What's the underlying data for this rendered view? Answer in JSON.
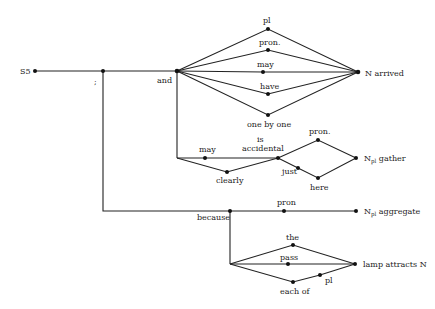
{
  "diagram": {
    "type": "sentence-generation-network",
    "start_label": "S5",
    "nodes": [
      {
        "id": "s5",
        "x": 35,
        "y": 71,
        "label": "S5"
      },
      {
        "id": "semi",
        "x": 103,
        "y": 71,
        "label": ";"
      },
      {
        "id": "and",
        "x": 177,
        "y": 71,
        "label": "and"
      },
      {
        "id": "pl1",
        "x": 268,
        "y": 29,
        "label": "pl"
      },
      {
        "id": "pron1",
        "x": 268,
        "y": 50,
        "label": "pron."
      },
      {
        "id": "may1",
        "x": 263,
        "y": 72,
        "label": "may"
      },
      {
        "id": "have",
        "x": 268,
        "y": 94,
        "label": "have"
      },
      {
        "id": "onebyone",
        "x": 268,
        "y": 115,
        "label": "one by one"
      },
      {
        "id": "narrived",
        "x": 358,
        "y": 72,
        "label": "N arrived"
      },
      {
        "id": "may2",
        "x": 205,
        "y": 158,
        "label": "may"
      },
      {
        "id": "clearly",
        "x": 227,
        "y": 172,
        "label": "clearly"
      },
      {
        "id": "isacc",
        "x": 278,
        "y": 158,
        "label": "is accidental"
      },
      {
        "id": "pron2",
        "x": 318,
        "y": 140,
        "label": "pron."
      },
      {
        "id": "just",
        "x": 298,
        "y": 168,
        "label": "just"
      },
      {
        "id": "here",
        "x": 318,
        "y": 178,
        "label": "here"
      },
      {
        "id": "ngather",
        "x": 356,
        "y": 158,
        "label": "N_pl gather"
      },
      {
        "id": "because",
        "x": 230,
        "y": 211,
        "label": "because"
      },
      {
        "id": "pron3",
        "x": 284,
        "y": 211,
        "label": "pron"
      },
      {
        "id": "naggregate",
        "x": 356,
        "y": 211,
        "label": "N_pl aggregate"
      },
      {
        "id": "the",
        "x": 293,
        "y": 245,
        "label": "the"
      },
      {
        "id": "pass",
        "x": 288,
        "y": 264,
        "label": "pass"
      },
      {
        "id": "eachof",
        "x": 293,
        "y": 282,
        "label": "each of"
      },
      {
        "id": "pl2",
        "x": 320,
        "y": 275,
        "label": "pl"
      },
      {
        "id": "lamp",
        "x": 355,
        "y": 264,
        "label": "lamp attracts N"
      }
    ]
  },
  "labels": {
    "s5": "S5",
    "semi": ";",
    "and": "and",
    "pl1": "pl",
    "pron1": "pron.",
    "may1": "may",
    "have": "have",
    "onebyone": "one by one",
    "narrived": "N arrived",
    "may2": "may",
    "is": "is",
    "accidental": "accidental",
    "clearly": "clearly",
    "pron2": "pron.",
    "just": "just",
    "here": "here",
    "ngather_n": "N",
    "ngather_sub": "pl",
    "ngather_rest": " gather",
    "because": "because",
    "pron3": "pron",
    "naggregate_n": "N",
    "naggregate_sub": "pl",
    "naggregate_rest": " aggregate",
    "the": "the",
    "pass": "pass",
    "eachof": "each of",
    "pl2": "pl",
    "lamp": "lamp attracts N"
  }
}
